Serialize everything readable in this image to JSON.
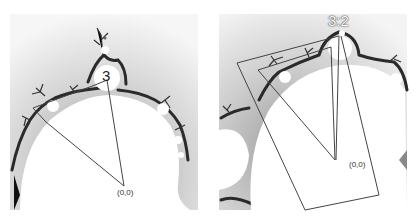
{
  "figure": {
    "left_panel": {
      "bulb_label": "3",
      "origin_label": "(0,0)"
    },
    "right_panel": {
      "bulb_label": "3:2",
      "origin_label": "(0,0)"
    },
    "colors": {
      "background_gradient_light": "#f4f4f4",
      "background_gradient_dark": "#bdbdbd",
      "fractal_edge": "#2a2a2a",
      "set_interior": "#ffffff",
      "line": "#444444"
    }
  }
}
